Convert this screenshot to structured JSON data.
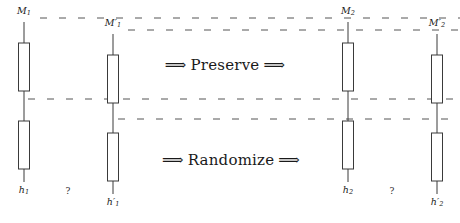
{
  "figure": {
    "background": "#ffffff",
    "stroke_color": "#3a3a3a",
    "dash_color": "#555555",
    "text_color": "#1a1a1a",
    "width": 460,
    "height": 223
  },
  "operations": [
    {
      "id": "preserve",
      "arrow_left": "⟹",
      "label": "Preserve",
      "arrow_right": "⟹",
      "x": 225,
      "y": 65
    },
    {
      "id": "randomize",
      "arrow_left": "⟹",
      "label": "Randomize",
      "arrow_right": "⟹",
      "x": 231,
      "y": 160
    }
  ],
  "columns": [
    {
      "id": "col-m1",
      "x": 24,
      "top_label": {
        "base": "M",
        "sub": "1",
        "prime": false,
        "y": 5
      },
      "bottom_label": {
        "base": "h",
        "sub": "1",
        "prime": false,
        "y": 184
      },
      "question_mark": null
    },
    {
      "id": "col-m1-prime",
      "x": 113,
      "top_label": {
        "base": "M",
        "sub": "1",
        "prime": true,
        "y": 17
      },
      "bottom_label": {
        "base": "h",
        "sub": "1",
        "prime": true,
        "y": 196
      },
      "question_mark": {
        "text": "?",
        "x": 68,
        "y": 186
      }
    },
    {
      "id": "col-m2",
      "x": 348,
      "top_label": {
        "base": "M",
        "sub": "2",
        "prime": false,
        "y": 5
      },
      "bottom_label": {
        "base": "h",
        "sub": "2",
        "prime": false,
        "y": 184
      },
      "question_mark": null
    },
    {
      "id": "col-m2-prime",
      "x": 437,
      "top_label": {
        "base": "M",
        "sub": "2",
        "prime": true,
        "y": 17
      },
      "bottom_label": {
        "base": "h",
        "sub": "2",
        "prime": true,
        "y": 196
      },
      "question_mark": {
        "text": "?",
        "x": 392,
        "y": 186
      }
    }
  ],
  "dashed_lines": [
    {
      "id": "dash-top-m1",
      "y": 18,
      "x1": 40,
      "x2": 460
    },
    {
      "id": "dash-top-m1-prime",
      "y": 30,
      "x1": 128,
      "x2": 460
    },
    {
      "id": "dash-mid-upper",
      "y": 99,
      "x1": 28,
      "x2": 460
    },
    {
      "id": "dash-mid-lower",
      "y": 119,
      "x1": 118,
      "x2": 460
    }
  ],
  "chain_geometry": {
    "note": "each column is a vertical line with two rectangular blocks",
    "upper_box": {
      "width": 11,
      "height": 48
    },
    "lower_box": {
      "width": 11,
      "height": 48
    }
  }
}
